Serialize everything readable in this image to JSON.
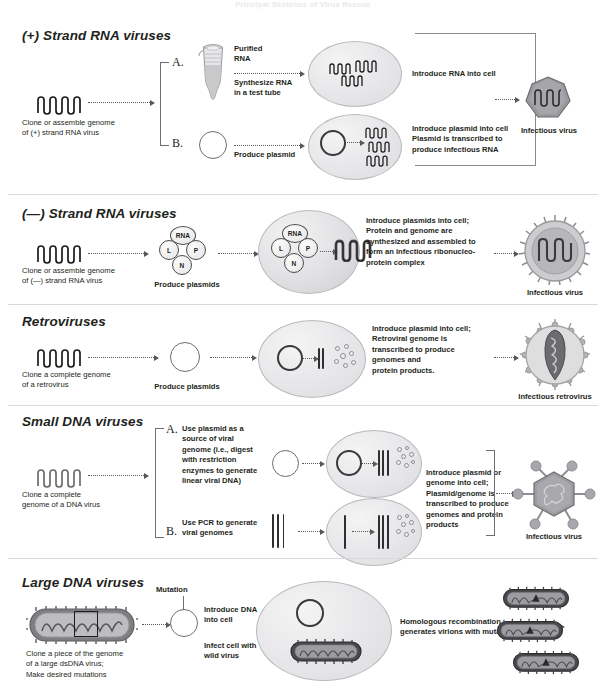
{
  "document": {
    "faded_header": "Principal Sketches of Virus Rescue",
    "accent_color": "#231f20",
    "cell_fill": "#e9e9eb",
    "virion_fill": "#9a9a9e",
    "dna_color": "#2f2f31"
  },
  "sections": [
    {
      "id": "plus-strand-rna",
      "title": "(+) Strand RNA viruses",
      "start_label": "Clone or assemble genome\nof (+) strand RNA virus",
      "branches": [
        {
          "letter": "A.",
          "labels": [
            "Purified\nRNA",
            "Synthesize RNA\nin a test tube",
            "Introduce RNA into cell"
          ],
          "icon": "test-tube-icon"
        },
        {
          "letter": "B.",
          "labels": [
            "Produce plasmid",
            "Introduce plasmid into cell\nPlasmid is transcribed to\nproduce infectious RNA"
          ],
          "icon": "plasmid-ring-icon"
        }
      ],
      "product_label": "Infectious virus"
    },
    {
      "id": "minus-strand-rna",
      "title": "(—) Strand RNA viruses",
      "start_label": "Clone or assemble genome\nof (—) strand RNA virus",
      "plasmid_label": "Produce plasmids",
      "nucleoprotein_parts": [
        "RNA",
        "L",
        "P",
        "N"
      ],
      "process_label": "Introduce plasmids into cell;\nProtein and genome are\nsynthesized and assembled to\nform an infectious ribonucleo-\nprotein complex",
      "product_label": "Infectious virus"
    },
    {
      "id": "retroviruses",
      "title": "Retroviruses",
      "start_label": "Clone a complete genome\nof a retrovirus",
      "plasmid_label": "Produce plasmids",
      "process_label": "Introduce plasmid into cell;\nRetroviral genome is\ntranscribed to produce\ngenomes and\nprotein products.",
      "product_label": "Infectious retrovirus"
    },
    {
      "id": "small-dna",
      "title": "Small DNA viruses",
      "start_label": "Clone a complete\ngenome of a DNA virus",
      "branches": [
        {
          "letter": "A.",
          "label": "Use plasmid as a\nsource of viral\ngenome (i.e., digest\nwith restriction\nenzymes to generate\nlinear viral DNA)",
          "icon": "plasmid-ring-icon"
        },
        {
          "letter": "B.",
          "label": "Use PCR to generate\nviral genomes",
          "icon": "dna-bars-icon"
        }
      ],
      "process_label": "Introduce plasmid or\ngenome into cell;\nPlasmid/genome is\ntranscribed to produce\ngenomes and protein\nproducts",
      "product_label": "Infectious virus"
    },
    {
      "id": "large-dna",
      "title": "Large DNA viruses",
      "start_label": "Clone a piece of the genome\nof a large dsDNA virus;\nMake desired mutations",
      "mutation_label": "Mutation",
      "step_labels": [
        "Introduce DNA\ninto cell",
        "Infect cell with\nwild virus"
      ],
      "process_label": "Homologous recombination\ngenerates virions with mutation",
      "virion_marker": "▲"
    }
  ]
}
